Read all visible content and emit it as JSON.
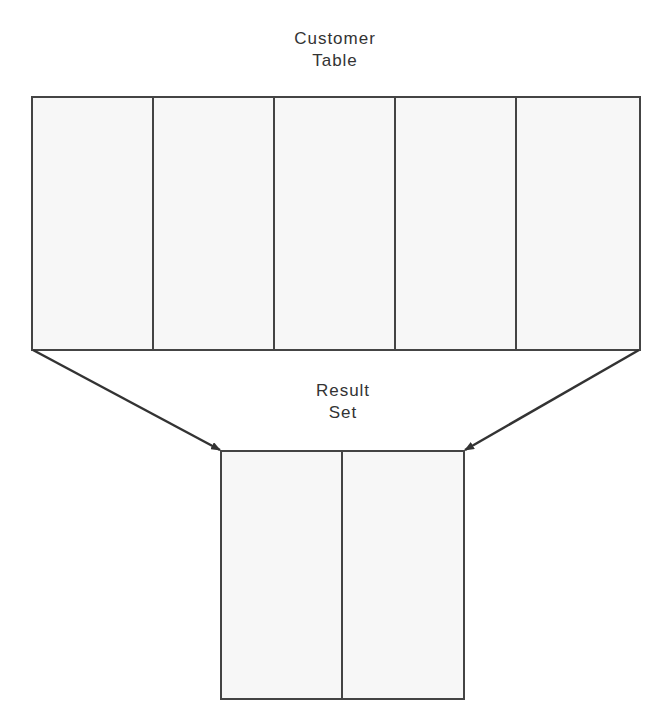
{
  "diagram": {
    "source_table": {
      "title_line1": "Customer",
      "title_line2": "Table",
      "column_count": 5
    },
    "result_set": {
      "title_line1": "Result",
      "title_line2": "Set",
      "column_count": 2
    },
    "arrows": [
      {
        "from": "source_table.bottom_left",
        "to": "result_set.top_left"
      },
      {
        "from": "source_table.bottom_right",
        "to": "result_set.top_right"
      }
    ],
    "colors": {
      "fill": "#f7f7f7",
      "stroke": "#444444",
      "text": "#333333"
    }
  }
}
